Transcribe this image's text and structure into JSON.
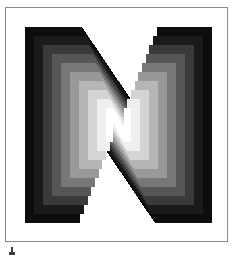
{
  "figure": {
    "kind": "logo-artwork",
    "subject_letter": "N",
    "alt_text": "Letter N logo with stepped greyscale gradient",
    "frame": {
      "border_color": "#8a8a8a",
      "border_width_px": 1,
      "background": "#ffffff",
      "x": 5,
      "y": 7,
      "width": 223,
      "height": 235
    },
    "background_color": "#ffffff"
  },
  "artwork": {
    "canvas": {
      "width": 187,
      "height": 196
    },
    "letter": "N",
    "letter_color_outer": "#0d0d0d",
    "letter_color_inner": "#ffffff",
    "counter_color": "#ffffff",
    "band_count": 9,
    "band_colors": [
      "#0d0d0d",
      "#1a1a1a",
      "#3a3a3a",
      "#565656",
      "#777777",
      "#989898",
      "#b6b6b6",
      "#d4d4d4",
      "#efefef"
    ],
    "band_labels": [
      "band-1-black",
      "band-2-near-black",
      "band-3-dark-grey",
      "band-4-mid-dark-grey",
      "band-5-mid-grey",
      "band-6-grey",
      "band-7-light-grey",
      "band-8-lighter-grey",
      "band-9-near-white"
    ],
    "step_size_px": 9,
    "diagonal_direction": "top-left to bottom-right",
    "stepping_style": "staircase on inner diagonal edges"
  },
  "caption": {
    "mark_color": "#3d3d3d",
    "mark_name": "figure-caption-mark",
    "mark_x": 9,
    "mark_y": 247
  }
}
